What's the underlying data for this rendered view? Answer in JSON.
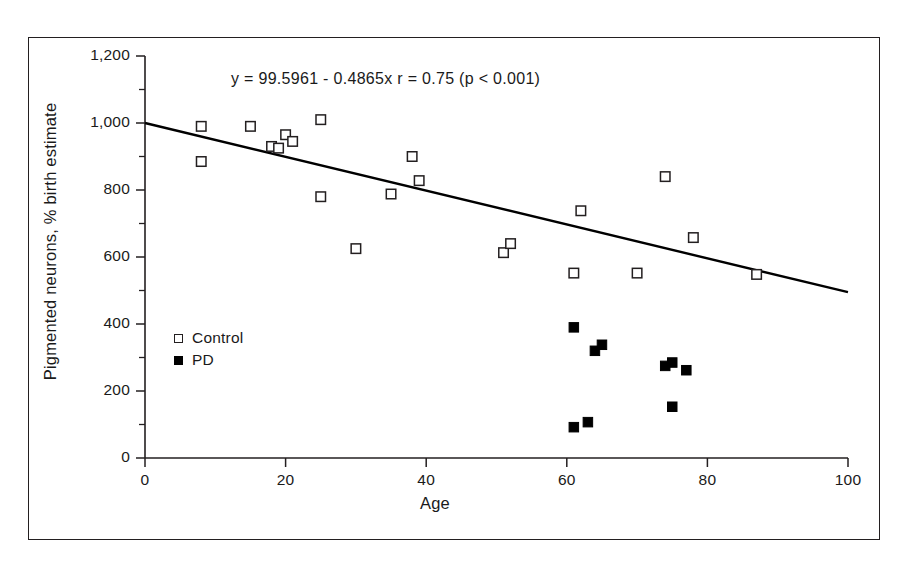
{
  "chart_data": {
    "type": "scatter",
    "title": "",
    "annotation": "y = 99.5961 - 0.4865x  r = 0.75 (p < 0.001)",
    "xlabel": "Age",
    "ylabel": "Pigmented neurons, % birth estimate",
    "xlim": [
      0,
      100
    ],
    "ylim": [
      0,
      1200
    ],
    "xticks": [
      0,
      20,
      40,
      60,
      80,
      100
    ],
    "xtick_labels": [
      "0",
      "20",
      "40",
      "60",
      "80",
      "100"
    ],
    "yticks": [
      0,
      200,
      400,
      600,
      800,
      1000,
      1200
    ],
    "ytick_labels": [
      "0",
      "200",
      "400",
      "600",
      "800",
      "1,000",
      "1,200"
    ],
    "yminor_ticks": [
      100,
      300,
      500,
      700,
      900,
      1100
    ],
    "grid": false,
    "legend_position": "inside-left",
    "series": [
      {
        "name": "Control",
        "marker": "open-square",
        "color": "#231f20",
        "points": [
          [
            8,
            885
          ],
          [
            8,
            990
          ],
          [
            15,
            990
          ],
          [
            18,
            930
          ],
          [
            19,
            925
          ],
          [
            20,
            965
          ],
          [
            21,
            945
          ],
          [
            25,
            1010
          ],
          [
            25,
            780
          ],
          [
            30,
            625
          ],
          [
            35,
            788
          ],
          [
            38,
            900
          ],
          [
            39,
            828
          ],
          [
            51,
            613
          ],
          [
            52,
            640
          ],
          [
            61,
            552
          ],
          [
            62,
            738
          ],
          [
            70,
            552
          ],
          [
            74,
            840
          ],
          [
            78,
            658
          ],
          [
            87,
            548
          ]
        ]
      },
      {
        "name": "PD",
        "marker": "filled-square",
        "color": "#000000",
        "points": [
          [
            61,
            390
          ],
          [
            61,
            92
          ],
          [
            63,
            107
          ],
          [
            64,
            320
          ],
          [
            65,
            338
          ],
          [
            74,
            275
          ],
          [
            75,
            285
          ],
          [
            75,
            153
          ],
          [
            77,
            262
          ]
        ]
      }
    ],
    "regression_line": {
      "intercept": 1000,
      "slope": -5.05,
      "x_start": 0,
      "x_end": 100,
      "y_start": 1000,
      "y_end": 495,
      "equation_text": "y = 99.5961 - 0.4865x",
      "r": "r = 0.75",
      "p": "(p < 0.001)"
    }
  },
  "legend": {
    "items": [
      {
        "label": "Control",
        "marker": "open-square"
      },
      {
        "label": "PD",
        "marker": "filled-square"
      }
    ]
  },
  "axes": {
    "x_title": "Age",
    "y_title": "Pigmented neurons, % birth estimate"
  },
  "colors": {
    "frame": "#231f20",
    "axis": "#231f20",
    "text": "#1a1a1a",
    "background": "#ffffff",
    "control_marker": "#231f20",
    "pd_marker": "#000000"
  }
}
